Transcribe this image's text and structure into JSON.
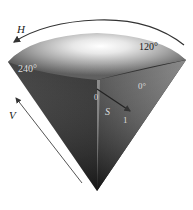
{
  "diagram": {
    "axes": {
      "hue": {
        "label": "H",
        "direction": "counter-clockwise around rim"
      },
      "value": {
        "label": "V",
        "direction": "apex to top"
      },
      "saturation": {
        "label": "S",
        "start": "0",
        "end": "1"
      }
    },
    "hue_angles": [
      {
        "label": "120°",
        "position": "top-right of rim"
      },
      {
        "label": "240°",
        "position": "left of rim"
      },
      {
        "label": "0°",
        "position": "right inner face"
      }
    ],
    "colors": {
      "cone_dark": "#1c1c1c",
      "cone_mid": "#6e6e6e",
      "cone_light": "#f2f2f2",
      "arrow": "#333333",
      "background": "#ffffff"
    }
  }
}
